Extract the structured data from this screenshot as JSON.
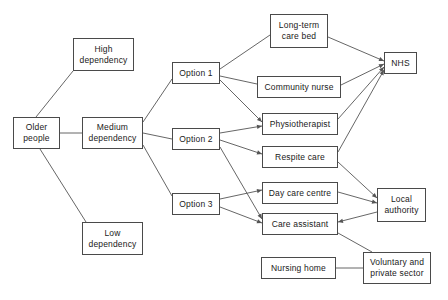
{
  "diagram": {
    "style": {
      "background": "#ffffff",
      "box_border_color": "#4a4a4a",
      "box_fill": "#ffffff",
      "edge_color": "#555555",
      "text_color": "#1a1a1a"
    },
    "nodes": [
      {
        "id": "older_people",
        "label": "Older\npeople",
        "x": 13,
        "y": 117,
        "w": 47,
        "h": 32
      },
      {
        "id": "high_dep",
        "label": "High\ndependency",
        "x": 73,
        "y": 38,
        "w": 61,
        "h": 33
      },
      {
        "id": "medium_dep",
        "label": "Medium\ndependency",
        "x": 82,
        "y": 117,
        "w": 61,
        "h": 32
      },
      {
        "id": "low_dep",
        "label": "Low\ndependency",
        "x": 82,
        "y": 222,
        "w": 61,
        "h": 33
      },
      {
        "id": "option1",
        "label": "Option 1",
        "x": 172,
        "y": 62,
        "w": 48,
        "h": 22
      },
      {
        "id": "option2",
        "label": "Option 2",
        "x": 172,
        "y": 128,
        "w": 48,
        "h": 22
      },
      {
        "id": "option3",
        "label": "Option 3",
        "x": 172,
        "y": 193,
        "w": 48,
        "h": 22
      },
      {
        "id": "long_term_bed",
        "label": "Long-term\ncare bed",
        "x": 270,
        "y": 14,
        "w": 58,
        "h": 34
      },
      {
        "id": "community_nurse",
        "label": "Community nurse",
        "x": 257,
        "y": 76,
        "w": 84,
        "h": 22
      },
      {
        "id": "physiotherapist",
        "label": "Physiotherapist",
        "x": 262,
        "y": 113,
        "w": 76,
        "h": 22
      },
      {
        "id": "respite_care",
        "label": "Respite care",
        "x": 262,
        "y": 146,
        "w": 76,
        "h": 22
      },
      {
        "id": "day_care",
        "label": "Day care centre",
        "x": 262,
        "y": 182,
        "w": 76,
        "h": 22
      },
      {
        "id": "care_assistant",
        "label": "Care assistant",
        "x": 262,
        "y": 213,
        "w": 76,
        "h": 22
      },
      {
        "id": "nursing_home",
        "label": "Nursing home",
        "x": 261,
        "y": 257,
        "w": 75,
        "h": 22
      },
      {
        "id": "nhs",
        "label": "NHS",
        "x": 384,
        "y": 52,
        "w": 33,
        "h": 22
      },
      {
        "id": "local_authority",
        "label": "Local\nauthority",
        "x": 377,
        "y": 188,
        "w": 49,
        "h": 34
      },
      {
        "id": "voluntary",
        "label": "Voluntary and\nprivate sector",
        "x": 363,
        "y": 252,
        "w": 68,
        "h": 32
      }
    ],
    "edges": [
      {
        "from": "older_people",
        "to": "high_dep",
        "x1": 36,
        "y1": 117,
        "x2": 73,
        "y2": 71,
        "arrow": false
      },
      {
        "from": "older_people",
        "to": "medium_dep",
        "x1": 60,
        "y1": 133,
        "x2": 82,
        "y2": 133,
        "arrow": false
      },
      {
        "from": "older_people",
        "to": "low_dep",
        "x1": 40,
        "y1": 149,
        "x2": 86,
        "y2": 222,
        "arrow": false
      },
      {
        "from": "medium_dep",
        "to": "option1",
        "x1": 143,
        "y1": 122,
        "x2": 172,
        "y2": 79,
        "arrow": false
      },
      {
        "from": "medium_dep",
        "to": "option2",
        "x1": 143,
        "y1": 133,
        "x2": 172,
        "y2": 139,
        "arrow": false
      },
      {
        "from": "medium_dep",
        "to": "option3",
        "x1": 143,
        "y1": 145,
        "x2": 172,
        "y2": 196,
        "arrow": false
      },
      {
        "from": "option1",
        "to": "long_term_bed",
        "x1": 220,
        "y1": 69,
        "x2": 270,
        "y2": 35,
        "arrow": false
      },
      {
        "from": "option1",
        "to": "community_nurse",
        "x1": 220,
        "y1": 76,
        "x2": 257,
        "y2": 84,
        "arrow": false
      },
      {
        "from": "option1",
        "to": "physiotherapist",
        "x1": 220,
        "y1": 80,
        "x2": 262,
        "y2": 122,
        "arrow": true
      },
      {
        "from": "option2",
        "to": "physiotherapist",
        "x1": 220,
        "y1": 133,
        "x2": 262,
        "y2": 126,
        "arrow": true
      },
      {
        "from": "option2",
        "to": "respite_care",
        "x1": 220,
        "y1": 140,
        "x2": 262,
        "y2": 154,
        "arrow": true
      },
      {
        "from": "option2",
        "to": "care_assistant",
        "x1": 220,
        "y1": 147,
        "x2": 262,
        "y2": 219,
        "arrow": true
      },
      {
        "from": "option3",
        "to": "day_care",
        "x1": 220,
        "y1": 199,
        "x2": 262,
        "y2": 190,
        "arrow": true
      },
      {
        "from": "option3",
        "to": "care_assistant",
        "x1": 220,
        "y1": 207,
        "x2": 262,
        "y2": 223,
        "arrow": true
      },
      {
        "from": "long_term_bed",
        "to": "nhs",
        "x1": 328,
        "y1": 37,
        "x2": 384,
        "y2": 61,
        "arrow": true
      },
      {
        "from": "community_nurse",
        "to": "nhs",
        "x1": 341,
        "y1": 85,
        "x2": 384,
        "y2": 64,
        "arrow": true
      },
      {
        "from": "physiotherapist",
        "to": "nhs",
        "x1": 338,
        "y1": 119,
        "x2": 384,
        "y2": 67,
        "arrow": true
      },
      {
        "from": "respite_care",
        "to": "nhs",
        "x1": 338,
        "y1": 152,
        "x2": 384,
        "y2": 70,
        "arrow": true
      },
      {
        "from": "respite_care",
        "to": "local_authority",
        "x1": 338,
        "y1": 162,
        "x2": 377,
        "y2": 198,
        "arrow": true
      },
      {
        "from": "day_care",
        "to": "local_authority",
        "x1": 338,
        "y1": 192,
        "x2": 377,
        "y2": 203,
        "arrow": true
      },
      {
        "from": "local_authority",
        "to": "care_assistant",
        "x1": 377,
        "y1": 212,
        "x2": 338,
        "y2": 222,
        "arrow": true
      },
      {
        "from": "care_assistant",
        "to": "voluntary",
        "x1": 338,
        "y1": 233,
        "x2": 372,
        "y2": 252,
        "arrow": false
      },
      {
        "from": "nursing_home",
        "to": "voluntary",
        "x1": 336,
        "y1": 268,
        "x2": 363,
        "y2": 268,
        "arrow": false
      }
    ]
  }
}
